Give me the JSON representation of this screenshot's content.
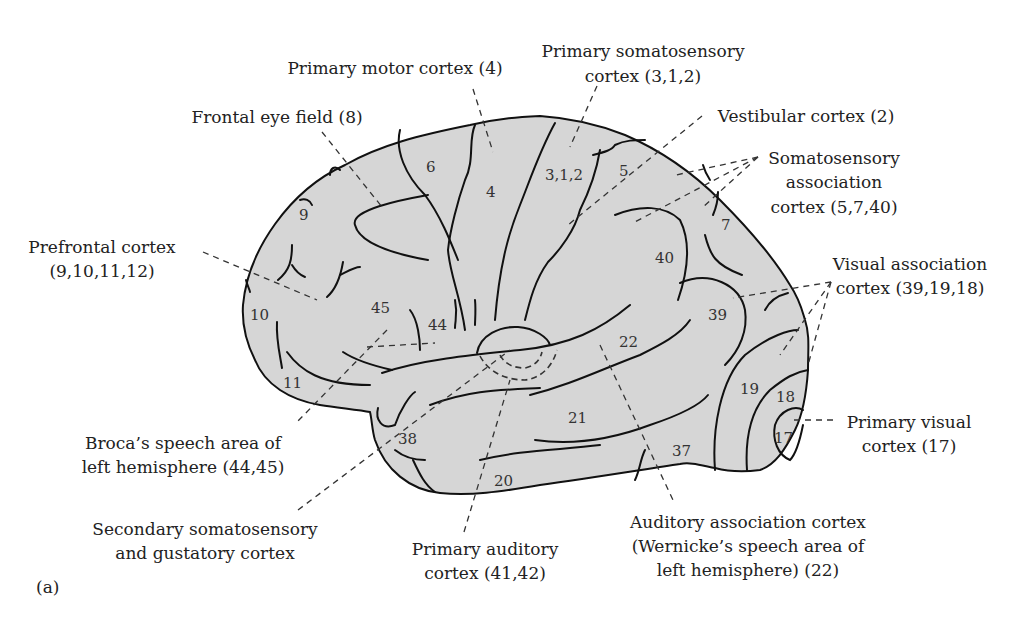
{
  "figure": {
    "panel_label": "(a)",
    "colors": {
      "brain_fill": "#d6d6d6",
      "outline": "#111111",
      "text": "#222222",
      "background": "#ffffff"
    }
  },
  "labels": {
    "primary_motor": {
      "line1": "Primary motor cortex (4)"
    },
    "primary_somatosensory": {
      "line1": "Primary somatosensory",
      "line2": "cortex (3,1,2)"
    },
    "frontal_eye_field": {
      "line1": "Frontal eye field (8)"
    },
    "vestibular": {
      "line1": "Vestibular cortex (2)"
    },
    "somatosensory_association": {
      "line1": "Somatosensory",
      "line2": "association",
      "line3": "cortex (5,7,40)"
    },
    "prefrontal": {
      "line1": "Prefrontal cortex",
      "line2": "(9,10,11,12)"
    },
    "visual_association": {
      "line1": "Visual association",
      "line2": "cortex (39,19,18)"
    },
    "primary_visual": {
      "line1": "Primary visual",
      "line2": "cortex (17)"
    },
    "broca": {
      "line1": "Broca’s speech area of",
      "line2": "left hemisphere (44,45)"
    },
    "secondary_somatosensory": {
      "line1": "Secondary somatosensory",
      "line2": "and gustatory cortex"
    },
    "primary_auditory": {
      "line1": "Primary auditory",
      "line2": "cortex (41,42)"
    },
    "auditory_association": {
      "line1": "Auditory association cortex",
      "line2": "(Wernicke’s speech area of",
      "line3": "left hemisphere) (22)"
    }
  },
  "brodmann_areas": {
    "a6": "6",
    "a4": "4",
    "a312": "3,1,2",
    "a5": "5",
    "a9": "9",
    "a7": "7",
    "a40": "40",
    "a39": "39",
    "a10": "10",
    "a45": "45",
    "a44": "44",
    "a22": "22",
    "a11": "11",
    "a19": "19",
    "a18": "18",
    "a21": "21",
    "a38": "38",
    "a17": "17",
    "a37": "37",
    "a20": "20"
  }
}
